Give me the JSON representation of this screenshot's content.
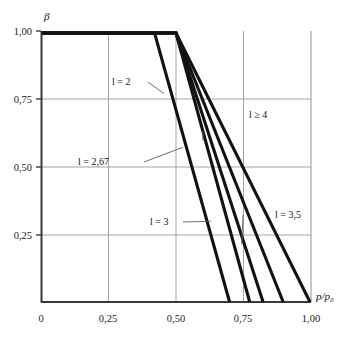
{
  "figure": {
    "title": "",
    "caption": ""
  },
  "axes": {
    "y_title": "β",
    "x_title": "p/p₀",
    "x_title_numerator": "p",
    "x_title_denominator": "p₀",
    "y_ticks": [
      "1,00",
      "0,75",
      "0,50",
      "0,25"
    ],
    "x_ticks": [
      "0",
      "0,25",
      "0,50",
      "0,75",
      "1,00"
    ]
  },
  "labels": {
    "l2": "l = 2",
    "l267": "l = 2,67",
    "l3": "l = 3",
    "l35": "l = 3,5",
    "l4": "l ≥ 4"
  },
  "colors": {
    "curve": "#121212",
    "grid": "#9b9b9b",
    "axis": "#3a3a3a",
    "background": "#ffffff",
    "leader": "#5c5c5c"
  },
  "chart_data": {
    "type": "line",
    "title": "",
    "xlabel": "p/p₀",
    "ylabel": "β",
    "xlim": [
      0,
      1.0
    ],
    "ylim": [
      0,
      1.0
    ],
    "grid": true,
    "legend": "inline-annotations",
    "x_tick_values": [
      0,
      0.25,
      0.5,
      0.75,
      1.0
    ],
    "y_tick_values": [
      0,
      0.25,
      0.5,
      0.75,
      1.0
    ],
    "series": [
      {
        "name": "l = 2",
        "label": "l = 2",
        "x": [
          0.0,
          0.42,
          0.7
        ],
        "y": [
          1.0,
          1.0,
          0.0
        ],
        "breakpoint": 0.42,
        "x_intercept": 0.7
      },
      {
        "name": "l = 2,67",
        "label": "l = 2,67",
        "x": [
          0.0,
          0.5,
          0.775
        ],
        "y": [
          1.0,
          1.0,
          0.0
        ],
        "breakpoint": 0.5,
        "x_intercept": 0.775
      },
      {
        "name": "l = 3",
        "label": "l = 3",
        "x": [
          0.0,
          0.5,
          0.825
        ],
        "y": [
          1.0,
          1.0,
          0.0
        ],
        "breakpoint": 0.5,
        "x_intercept": 0.825
      },
      {
        "name": "l = 3,5",
        "label": "l = 3,5",
        "x": [
          0.0,
          0.5,
          0.9
        ],
        "y": [
          1.0,
          1.0,
          0.0
        ],
        "breakpoint": 0.5,
        "x_intercept": 0.9
      },
      {
        "name": "l ≥ 4",
        "label": "l ≥ 4",
        "x": [
          0.0,
          0.5,
          1.0
        ],
        "y": [
          1.0,
          1.0,
          0.0
        ],
        "breakpoint": 0.5,
        "x_intercept": 1.0
      }
    ],
    "annotations": [
      {
        "text": "l = 2",
        "tx": 0.245,
        "ty": 0.805,
        "lx": 0.455,
        "ly": 0.775
      },
      {
        "text": "l = 2,67",
        "tx": 0.175,
        "ty": 0.545,
        "lx": 0.525,
        "ly": 0.575
      },
      {
        "text": "l = 3",
        "tx": 0.405,
        "ty": 0.255,
        "lx": 0.63,
        "ly": 0.3
      },
      {
        "text": "l = 3,5",
        "tx": 0.845,
        "ty": 0.32,
        "lx": 0.745,
        "ly": 0.215
      },
      {
        "text": "l ≥ 4",
        "tx": 0.81,
        "ty": 0.67,
        "lx": 0.6,
        "ly": 0.6
      }
    ]
  }
}
